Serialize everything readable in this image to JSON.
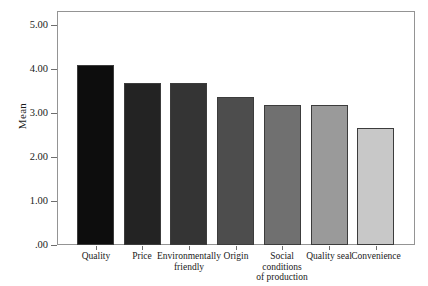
{
  "chart_data": {
    "type": "bar",
    "title": "",
    "subtitle": "",
    "xlabel": "",
    "ylabel": "Mean",
    "categories": [
      "Quality",
      "Price",
      "Environmentally friendly",
      "Origin",
      "Social conditions of production",
      "Quality seal",
      "Convenience"
    ],
    "category_lines": [
      [
        "Quality"
      ],
      [
        "Price"
      ],
      [
        "Environmentally",
        "friendly"
      ],
      [
        "Origin"
      ],
      [
        "Social",
        "conditions",
        "of production"
      ],
      [
        "Quality seal"
      ],
      [
        "Convenience"
      ]
    ],
    "values": [
      4.09,
      3.68,
      3.68,
      3.36,
      3.18,
      3.18,
      2.66
    ],
    "bar_colors": [
      "#0d0d0d",
      "#232323",
      "#343434",
      "#4d4d4d",
      "#707070",
      "#9a9a9a",
      "#c8c8c8"
    ],
    "bar_border_color": "#3c3c3c",
    "ylim": [
      0.0,
      5.0
    ],
    "ytick_values": [
      0.0,
      1.0,
      2.0,
      3.0,
      4.0,
      5.0
    ],
    "ytick_labels": [
      ".00",
      "1.00",
      "2.00",
      "3.00",
      "4.00",
      "5.00"
    ],
    "grid": false,
    "legend": null,
    "legend_position": "none",
    "frame_color": "#949494",
    "background": "#ffffff"
  }
}
